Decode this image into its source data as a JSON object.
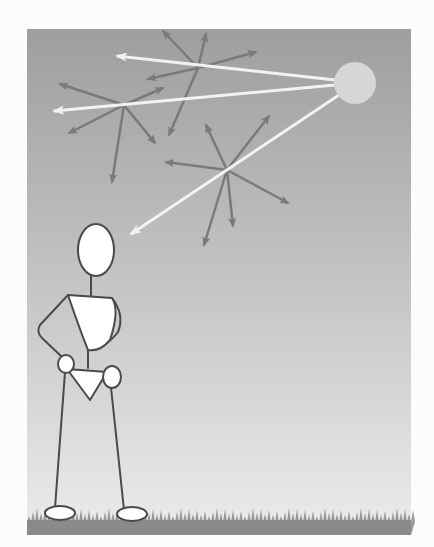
{
  "illustration": {
    "subject": "Rayleigh scattering of sunlight in the sky",
    "colors": {
      "page_background": "#fcfcfc",
      "sky_top": "#9e9e9e",
      "sky_bottom": "#ececec",
      "sun": "#d6d6d6",
      "light_ray": "#f2f2f2",
      "scattered_ray": "#7a7a7a",
      "figure_fill": "#ffffff",
      "figure_stroke": "#4a4a4a",
      "grass": "#8a8a8a"
    },
    "frame": {
      "x": 27,
      "y": 29,
      "width": 384,
      "height": 506
    },
    "sun": {
      "cx": 355,
      "cy": 83,
      "r": 21
    },
    "light_rays": [
      {
        "name": "ray-top",
        "from": [
          335,
          80
        ],
        "to": [
          117,
          56
        ]
      },
      {
        "name": "ray-middle",
        "from": [
          335,
          85
        ],
        "to": [
          54,
          111
        ]
      },
      {
        "name": "ray-bottom",
        "from": [
          339,
          95
        ],
        "to": [
          131,
          234
        ]
      }
    ],
    "scatter_clusters": [
      {
        "name": "cluster-upper",
        "center": [
          198,
          68
        ],
        "arrows": [
          [
            163,
            31
          ],
          [
            206,
            34
          ],
          [
            256,
            52
          ],
          [
            148,
            79
          ],
          [
            169,
            135
          ]
        ]
      },
      {
        "name": "cluster-left",
        "center": [
          124,
          105
        ],
        "arrows": [
          [
            60,
            84
          ],
          [
            163,
            88
          ],
          [
            69,
            133
          ],
          [
            155,
            143
          ],
          [
            112,
            182
          ]
        ]
      },
      {
        "name": "cluster-lower",
        "center": [
          227,
          170
        ],
        "arrows": [
          [
            206,
            125
          ],
          [
            269,
            116
          ],
          [
            166,
            162
          ],
          [
            288,
            203
          ],
          [
            233,
            226
          ],
          [
            204,
            245
          ]
        ]
      }
    ],
    "observer": {
      "head": {
        "cx": 96,
        "cy": 250,
        "rx": 18,
        "ry": 26
      },
      "ground_y": 518
    }
  }
}
